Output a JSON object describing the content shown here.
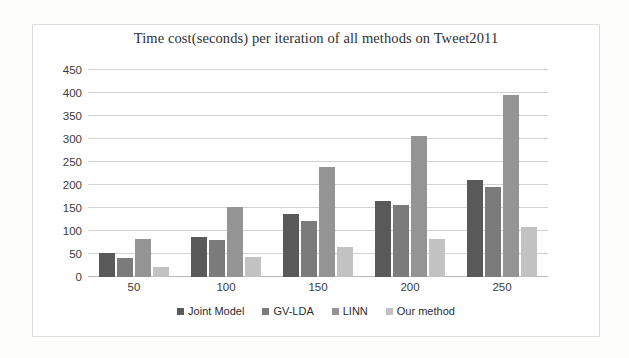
{
  "chart_data": {
    "type": "bar",
    "title": "Time cost(seconds) per iteration of all methods on Tweet2011",
    "xlabel": "",
    "ylabel": "",
    "categories": [
      "50",
      "100",
      "150",
      "200",
      "250"
    ],
    "series": [
      {
        "name": "Joint Model",
        "color": "#595959",
        "values": [
          52,
          87,
          137,
          165,
          211
        ]
      },
      {
        "name": "GV-LDA",
        "color": "#7b7b7b",
        "values": [
          42,
          80,
          121,
          157,
          196
        ]
      },
      {
        "name": "LINN",
        "color": "#949494",
        "values": [
          82,
          153,
          240,
          306,
          395
        ]
      },
      {
        "name": "Our method",
        "color": "#c2c2c2",
        "values": [
          21,
          44,
          65,
          83,
          108
        ]
      }
    ],
    "ylim": [
      0,
      450
    ],
    "ytick_labels": [
      "0",
      "50",
      "100",
      "150",
      "200",
      "250",
      "300",
      "350",
      "400",
      "450"
    ],
    "ytick_values": [
      0,
      50,
      100,
      150,
      200,
      250,
      300,
      350,
      400,
      450
    ],
    "grid": true,
    "legend_position": "bottom",
    "gridline_color": "#d2d2d0",
    "plot_background": "#ffffff"
  }
}
